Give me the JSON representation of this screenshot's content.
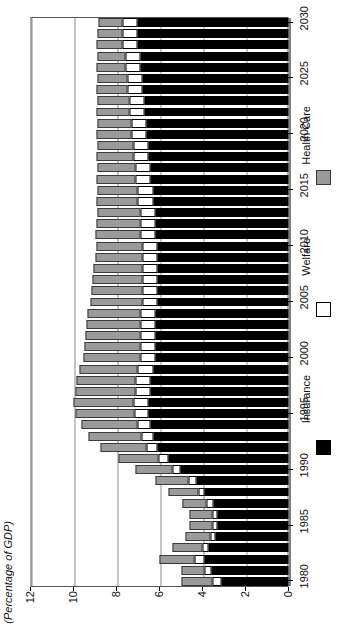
{
  "chart_data": {
    "type": "bar",
    "orientation": "horizontal-rotated",
    "title": "",
    "xlabel": "",
    "ylabel": "(Percentage of GDP)",
    "value_axis_label": "(Percentage of GDP)",
    "value_ticks": [
      0,
      2,
      4,
      6,
      8,
      10,
      12
    ],
    "ylim": [
      0,
      12
    ],
    "category_axis_ticks": [
      1980,
      1985,
      1990,
      1995,
      2000,
      2005,
      2010,
      2015,
      2020,
      2025,
      2030
    ],
    "xlim": [
      1980,
      2030
    ],
    "grid": true,
    "legend_position": "right",
    "stacked": true,
    "legend": [
      {
        "name": "Insurance",
        "color": "#000000"
      },
      {
        "name": "Welfare",
        "color": "#ffffff"
      },
      {
        "name": "Health Care",
        "color": "#9a9a9a"
      }
    ],
    "categories": [
      1980,
      1981,
      1982,
      1983,
      1984,
      1985,
      1986,
      1987,
      1988,
      1989,
      1990,
      1991,
      1992,
      1993,
      1994,
      1995,
      1996,
      1997,
      1998,
      1999,
      2000,
      2001,
      2002,
      2003,
      2004,
      2005,
      2006,
      2007,
      2008,
      2009,
      2010,
      2011,
      2012,
      2013,
      2014,
      2015,
      2016,
      2017,
      2018,
      2019,
      2020,
      2021,
      2022,
      2023,
      2024,
      2025,
      2026,
      2027,
      2028,
      2029,
      2030
    ],
    "series": [
      {
        "name": "Insurance",
        "color": "#000000",
        "values": [
          3.1,
          3.6,
          3.9,
          3.7,
          3.4,
          3.3,
          3.3,
          3.5,
          3.9,
          4.3,
          5.0,
          5.6,
          6.1,
          6.3,
          6.4,
          6.5,
          6.5,
          6.4,
          6.4,
          6.3,
          6.2,
          6.2,
          6.2,
          6.2,
          6.2,
          6.1,
          6.1,
          6.1,
          6.1,
          6.1,
          6.1,
          6.2,
          6.2,
          6.2,
          6.3,
          6.3,
          6.4,
          6.4,
          6.5,
          6.5,
          6.6,
          6.6,
          6.7,
          6.7,
          6.8,
          6.8,
          6.9,
          6.9,
          7.0,
          7.0,
          7.0
        ]
      },
      {
        "name": "Welfare",
        "color": "#ffffff",
        "values": [
          0.45,
          0.3,
          0.45,
          0.3,
          0.25,
          0.25,
          0.25,
          0.3,
          0.3,
          0.35,
          0.4,
          0.45,
          0.5,
          0.55,
          0.6,
          0.65,
          0.7,
          0.7,
          0.7,
          0.7,
          0.7,
          0.7,
          0.7,
          0.7,
          0.7,
          0.7,
          0.7,
          0.7,
          0.7,
          0.7,
          0.7,
          0.7,
          0.7,
          0.7,
          0.7,
          0.7,
          0.7,
          0.7,
          0.7,
          0.7,
          0.7,
          0.7,
          0.7,
          0.7,
          0.7,
          0.7,
          0.7,
          0.7,
          0.7,
          0.7,
          0.7
        ]
      },
      {
        "name": "Health Care",
        "color": "#9a9a9a",
        "values": [
          1.45,
          1.1,
          1.65,
          1.4,
          1.15,
          1.05,
          1.05,
          1.15,
          1.4,
          1.55,
          1.7,
          1.85,
          2.15,
          2.45,
          2.65,
          2.75,
          2.8,
          2.8,
          2.75,
          2.7,
          2.65,
          2.6,
          2.55,
          2.5,
          2.45,
          2.4,
          2.35,
          2.3,
          2.25,
          2.2,
          2.15,
          2.1,
          2.05,
          2.0,
          1.95,
          1.9,
          1.85,
          1.8,
          1.75,
          1.7,
          1.65,
          1.6,
          1.55,
          1.5,
          1.45,
          1.4,
          1.35,
          1.3,
          1.25,
          1.2,
          1.15
        ]
      }
    ]
  }
}
